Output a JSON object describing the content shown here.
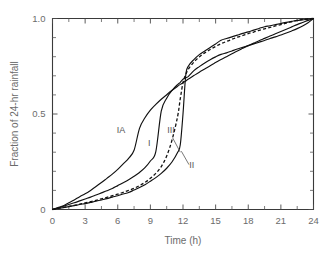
{
  "chart_data": {
    "type": "line",
    "title": "",
    "xlabel": "Time (h)",
    "ylabel": "Fraction of 24-hr rainfall",
    "xlim": [
      0,
      24
    ],
    "ylim": [
      0,
      1.0
    ],
    "xticks": [
      0,
      3,
      6,
      9,
      12,
      15,
      18,
      21,
      24
    ],
    "xticklabels": [
      "0",
      "3",
      "6",
      "9",
      "12",
      "15",
      "18",
      "21",
      "24"
    ],
    "xminor_step": 1.5,
    "yticks": [
      0,
      0.5,
      1.0
    ],
    "yticklabels": [
      "0",
      "0.5",
      "1.0"
    ],
    "yminor_step": 0.1,
    "grid": false,
    "legend": "inline-annotations",
    "x": [
      0,
      0.5,
      1,
      1.5,
      2,
      2.5,
      3,
      3.5,
      4,
      4.5,
      5,
      5.5,
      6,
      6.5,
      7,
      7.5,
      8,
      8.5,
      9,
      9.5,
      10,
      10.5,
      11,
      11.5,
      11.75,
      12,
      12.25,
      12.5,
      13,
      13.5,
      14,
      14.5,
      15,
      15.5,
      16,
      16.5,
      17,
      17.5,
      18,
      18.5,
      19,
      19.5,
      20,
      20.5,
      21,
      21.5,
      22,
      22.5,
      23,
      23.5,
      24
    ],
    "series": [
      {
        "name": "I",
        "label": "I",
        "style": "solid",
        "values": [
          0,
          0.008,
          0.017,
          0.026,
          0.035,
          0.045,
          0.055,
          0.065,
          0.076,
          0.087,
          0.098,
          0.11,
          0.125,
          0.14,
          0.156,
          0.174,
          0.194,
          0.219,
          0.254,
          0.303,
          0.515,
          0.583,
          0.624,
          0.654,
          0.666,
          0.682,
          0.689,
          0.697,
          0.727,
          0.748,
          0.767,
          0.784,
          0.799,
          0.812,
          0.82,
          0.83,
          0.84,
          0.849,
          0.858,
          0.867,
          0.876,
          0.885,
          0.895,
          0.904,
          0.914,
          0.924,
          0.935,
          0.947,
          0.961,
          0.978,
          1.0
        ]
      },
      {
        "name": "IA",
        "label": "IA",
        "style": "solid",
        "values": [
          0,
          0.01,
          0.02,
          0.035,
          0.05,
          0.067,
          0.082,
          0.1,
          0.12,
          0.141,
          0.163,
          0.185,
          0.21,
          0.239,
          0.268,
          0.31,
          0.425,
          0.48,
          0.52,
          0.55,
          0.577,
          0.601,
          0.624,
          0.645,
          0.655,
          0.664,
          0.673,
          0.683,
          0.701,
          0.719,
          0.736,
          0.753,
          0.769,
          0.785,
          0.8,
          0.815,
          0.83,
          0.844,
          0.858,
          0.871,
          0.884,
          0.896,
          0.908,
          0.92,
          0.932,
          0.944,
          0.956,
          0.968,
          0.979,
          0.99,
          1.0
        ]
      },
      {
        "name": "II",
        "label": "II",
        "style": "dashed",
        "values": [
          0,
          0.005,
          0.011,
          0.016,
          0.022,
          0.028,
          0.035,
          0.041,
          0.048,
          0.056,
          0.064,
          0.072,
          0.08,
          0.09,
          0.1,
          0.111,
          0.125,
          0.142,
          0.163,
          0.189,
          0.225,
          0.28,
          0.366,
          0.486,
          0.58,
          0.664,
          0.707,
          0.735,
          0.772,
          0.799,
          0.82,
          0.838,
          0.854,
          0.868,
          0.88,
          0.891,
          0.902,
          0.911,
          0.921,
          0.929,
          0.938,
          0.946,
          0.953,
          0.961,
          0.968,
          0.976,
          0.983,
          0.99,
          0.995,
          0.998,
          1.0
        ]
      },
      {
        "name": "III",
        "label": "III",
        "style": "solid",
        "values": [
          0,
          0.005,
          0.01,
          0.015,
          0.02,
          0.026,
          0.031,
          0.037,
          0.043,
          0.05,
          0.057,
          0.065,
          0.072,
          0.081,
          0.089,
          0.102,
          0.115,
          0.13,
          0.148,
          0.167,
          0.189,
          0.216,
          0.25,
          0.298,
          0.339,
          0.5,
          0.702,
          0.751,
          0.785,
          0.811,
          0.83,
          0.848,
          0.867,
          0.886,
          0.895,
          0.904,
          0.913,
          0.922,
          0.93,
          0.939,
          0.948,
          0.957,
          0.962,
          0.968,
          0.974,
          0.98,
          0.985,
          0.99,
          0.993,
          0.997,
          1.0
        ]
      }
    ],
    "annotations": [
      {
        "text": "IA",
        "x": 6.3,
        "y": 0.4
      },
      {
        "text": "I",
        "x": 8.9,
        "y": 0.335
      },
      {
        "text": "III",
        "x": 10.9,
        "y": 0.4
      },
      {
        "text": "II",
        "x": 12.8,
        "y": 0.215
      }
    ]
  }
}
